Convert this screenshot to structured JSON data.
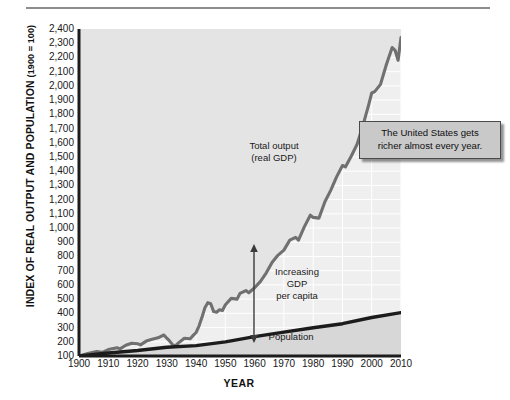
{
  "figure": {
    "ylabel_main": "INDEX OF REAL OUTPUT AND POPULATION",
    "ylabel_suffix": "(1900 = 100)",
    "xlabel": "YEAR"
  },
  "callout": {
    "line1": "The United States gets",
    "line2": "richer almost every year."
  },
  "annotations": {
    "gdp_label_line1": "Total output",
    "gdp_label_line2": "(real GDP)",
    "gap_label_line1": "Increasing",
    "gap_label_line2": "GDP",
    "gap_label_line3": "per capita",
    "population_label": "Population"
  },
  "colors": {
    "gdp_line": "#707070",
    "population_line": "#1c1c1c",
    "plot_background": "#efefef",
    "gridline": "#ffffff",
    "axis": "#1c1c1c",
    "callout_fill": "#c9c9c9",
    "fill_above_gdp": "#e2e2e2"
  },
  "chart_data": {
    "type": "line",
    "title": "",
    "xlabel": "YEAR",
    "ylabel": "INDEX OF REAL OUTPUT AND POPULATION (1900 = 100)",
    "xlim": [
      1900,
      2010
    ],
    "ylim": [
      100,
      2400
    ],
    "yticks": [
      100,
      200,
      300,
      400,
      500,
      600,
      700,
      800,
      900,
      1000,
      1100,
      1200,
      1300,
      1400,
      1500,
      1600,
      1700,
      1800,
      1900,
      2000,
      2100,
      2200,
      2300,
      2400
    ],
    "ytick_labels": [
      "100",
      "200",
      "300",
      "400",
      "500",
      "600",
      "700",
      "800",
      "900",
      "1,000",
      "1,100",
      "1,200",
      "1,300",
      "1,400",
      "1,500",
      "1,600",
      "1,700",
      "1,800",
      "1,900",
      "2,000",
      "2,100",
      "2,200",
      "2,300",
      "2,400"
    ],
    "xticks": [
      1900,
      1910,
      1920,
      1930,
      1940,
      1950,
      1960,
      1970,
      1980,
      1990,
      2000,
      2010
    ],
    "xtick_labels": [
      "1900",
      "1910",
      "1920",
      "1930",
      "1940",
      "1950",
      "1960",
      "1970",
      "1980",
      "1990",
      "2000",
      "2010"
    ],
    "grid": true,
    "legend": "annotations-in-plot",
    "series": [
      {
        "name": "Total output (real GDP)",
        "color": "#707070",
        "x": [
          1900,
          1903,
          1906,
          1908,
          1910,
          1913,
          1914,
          1916,
          1918,
          1920,
          1921,
          1923,
          1925,
          1927,
          1929,
          1930,
          1931,
          1932,
          1933,
          1934,
          1936,
          1938,
          1939,
          1940,
          1941,
          1942,
          1943,
          1944,
          1945,
          1946,
          1947,
          1948,
          1949,
          1950,
          1952,
          1954,
          1955,
          1957,
          1958,
          1960,
          1962,
          1964,
          1966,
          1968,
          1970,
          1972,
          1974,
          1975,
          1977,
          1979,
          1980,
          1982,
          1984,
          1986,
          1988,
          1990,
          1991,
          1993,
          1995,
          1997,
          1999,
          2000,
          2001,
          2003,
          2005,
          2007,
          2008,
          2009,
          2010
        ],
        "y": [
          100,
          118,
          132,
          126,
          145,
          158,
          150,
          175,
          190,
          186,
          178,
          205,
          218,
          228,
          248,
          225,
          205,
          178,
          172,
          192,
          225,
          222,
          245,
          265,
          310,
          370,
          440,
          475,
          468,
          412,
          408,
          425,
          420,
          460,
          505,
          500,
          540,
          560,
          545,
          580,
          625,
          685,
          760,
          810,
          845,
          915,
          935,
          915,
          1010,
          1090,
          1075,
          1070,
          1185,
          1265,
          1360,
          1440,
          1430,
          1505,
          1590,
          1720,
          1870,
          1950,
          1960,
          2010,
          2150,
          2270,
          2250,
          2180,
          2340
        ]
      },
      {
        "name": "Population",
        "color": "#1c1c1c",
        "x": [
          1900,
          1910,
          1920,
          1930,
          1940,
          1950,
          1960,
          1970,
          1980,
          1990,
          2000,
          2010
        ],
        "y": [
          100,
          121,
          139,
          161,
          173,
          199,
          236,
          268,
          298,
          327,
          371,
          405
        ]
      }
    ],
    "annotations": [
      {
        "text": "Total output (real GDP)",
        "x": 1963,
        "y": 1500
      },
      {
        "text": "Increasing GDP per capita",
        "x": 1978,
        "y": 620
      },
      {
        "text": "Population",
        "x": 1982,
        "y": 215
      },
      {
        "text": "The United States gets richer almost every year.",
        "x": 2000,
        "y": 1750
      }
    ]
  }
}
